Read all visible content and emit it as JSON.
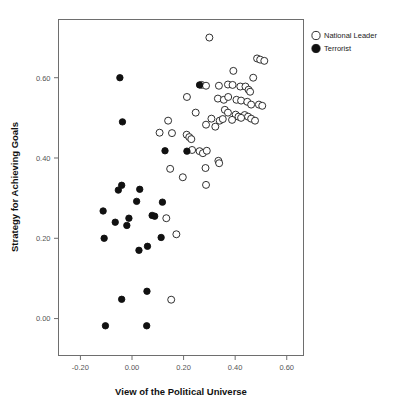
{
  "chart_data": {
    "type": "scatter",
    "title": "",
    "xlabel": "View of the Political Universe",
    "ylabel": "Strategy for Achieving Goals",
    "xlim": [
      -0.285,
      0.665
    ],
    "ylim": [
      -0.092,
      0.745
    ],
    "xticks": [
      -0.2,
      0.0,
      0.2,
      0.4,
      0.6
    ],
    "xticklabels": [
      "-0.20",
      "0.00",
      "0.20",
      "0.40",
      "0.60"
    ],
    "yticks": [
      0.0,
      0.2,
      0.4,
      0.6
    ],
    "yticklabels": [
      "0.00",
      "0.20",
      "0.40",
      "0.60"
    ],
    "grid": false,
    "legend_position": "outside-top-right",
    "marker_colors": {
      "national_leader_fill": "#ffffff",
      "national_leader_stroke": "#1a1a1a",
      "terrorist_fill": "#111111",
      "terrorist_stroke": "#111111",
      "frame": "#6e6e6e"
    },
    "series": [
      {
        "name": "National Leader",
        "marker": "open-circle",
        "points": [
          [
            0.3,
            0.7
          ],
          [
            0.485,
            0.648
          ],
          [
            0.497,
            0.645
          ],
          [
            0.513,
            0.642
          ],
          [
            0.393,
            0.617
          ],
          [
            0.47,
            0.6
          ],
          [
            0.27,
            0.582
          ],
          [
            0.287,
            0.58
          ],
          [
            0.337,
            0.58
          ],
          [
            0.372,
            0.583
          ],
          [
            0.39,
            0.582
          ],
          [
            0.42,
            0.578
          ],
          [
            0.44,
            0.578
          ],
          [
            0.452,
            0.57
          ],
          [
            0.458,
            0.565
          ],
          [
            0.213,
            0.552
          ],
          [
            0.333,
            0.548
          ],
          [
            0.356,
            0.545
          ],
          [
            0.373,
            0.552
          ],
          [
            0.405,
            0.545
          ],
          [
            0.423,
            0.543
          ],
          [
            0.447,
            0.54
          ],
          [
            0.462,
            0.533
          ],
          [
            0.492,
            0.533
          ],
          [
            0.505,
            0.53
          ],
          [
            0.247,
            0.513
          ],
          [
            0.36,
            0.52
          ],
          [
            0.372,
            0.513
          ],
          [
            0.402,
            0.508
          ],
          [
            0.413,
            0.503
          ],
          [
            0.437,
            0.507
          ],
          [
            0.45,
            0.503
          ],
          [
            0.14,
            0.493
          ],
          [
            0.308,
            0.498
          ],
          [
            0.34,
            0.493
          ],
          [
            0.352,
            0.497
          ],
          [
            0.388,
            0.495
          ],
          [
            0.423,
            0.5
          ],
          [
            0.462,
            0.498
          ],
          [
            0.477,
            0.493
          ],
          [
            0.107,
            0.463
          ],
          [
            0.155,
            0.462
          ],
          [
            0.212,
            0.458
          ],
          [
            0.222,
            0.452
          ],
          [
            0.23,
            0.447
          ],
          [
            0.287,
            0.483
          ],
          [
            0.323,
            0.478
          ],
          [
            0.233,
            0.42
          ],
          [
            0.262,
            0.417
          ],
          [
            0.275,
            0.412
          ],
          [
            0.29,
            0.418
          ],
          [
            0.335,
            0.393
          ],
          [
            0.338,
            0.387
          ],
          [
            0.148,
            0.373
          ],
          [
            0.285,
            0.375
          ],
          [
            0.197,
            0.352
          ],
          [
            0.287,
            0.333
          ],
          [
            0.133,
            0.25
          ],
          [
            0.172,
            0.21
          ],
          [
            0.152,
            0.047
          ]
        ]
      },
      {
        "name": "Terrorist",
        "marker": "filled-circle",
        "points": [
          [
            -0.047,
            0.6
          ],
          [
            -0.037,
            0.49
          ],
          [
            0.262,
            0.582
          ],
          [
            -0.04,
            0.332
          ],
          [
            -0.053,
            0.32
          ],
          [
            0.03,
            0.322
          ],
          [
            0.118,
            0.29
          ],
          [
            0.018,
            0.292
          ],
          [
            0.128,
            0.418
          ],
          [
            0.213,
            0.417
          ],
          [
            -0.112,
            0.268
          ],
          [
            -0.012,
            0.25
          ],
          [
            0.078,
            0.257
          ],
          [
            0.088,
            0.255
          ],
          [
            -0.065,
            0.24
          ],
          [
            -0.02,
            0.232
          ],
          [
            -0.108,
            0.2
          ],
          [
            0.113,
            0.202
          ],
          [
            0.06,
            0.18
          ],
          [
            0.027,
            0.17
          ],
          [
            0.058,
            0.068
          ],
          [
            -0.04,
            0.048
          ],
          [
            -0.103,
            -0.018
          ],
          [
            0.057,
            -0.018
          ]
        ]
      }
    ]
  },
  "legend": {
    "items": [
      {
        "label": "National Leader",
        "marker": "open-circle"
      },
      {
        "label": "Terrorist",
        "marker": "filled-circle"
      }
    ]
  }
}
